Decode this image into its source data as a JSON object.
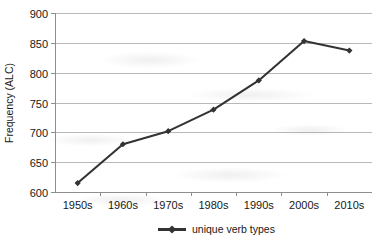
{
  "chart_data": {
    "type": "line",
    "title": "",
    "xlabel": "",
    "ylabel": "Frequency (ALC)",
    "categories": [
      "1950s",
      "1960s",
      "1970s",
      "1980s",
      "1990s",
      "2000s",
      "2010s"
    ],
    "series": [
      {
        "name": "unique verb types",
        "values": [
          615,
          680,
          702,
          738,
          787,
          853,
          837
        ],
        "color": "#333333",
        "marker": "diamond"
      }
    ],
    "ylim": [
      600,
      900
    ],
    "yticks": [
      600,
      650,
      700,
      750,
      800,
      850,
      900
    ],
    "ytick_labels": [
      "600",
      "650",
      "700",
      "750",
      "800",
      "850",
      "900"
    ],
    "grid": "horizontal",
    "grid_color": "#b9b9b9",
    "legend_position": "bottom",
    "legend_entries": [
      "unique verb types"
    ],
    "plot_background": "#ffffff",
    "axis_color": "#9a9a9a"
  },
  "axes": {
    "y_title": "Frequency (ALC)"
  },
  "legend": {
    "entry_0": "unique verb types"
  },
  "ticks": {
    "y": {
      "t0": "600",
      "t1": "650",
      "t2": "700",
      "t3": "750",
      "t4": "800",
      "t5": "850",
      "t6": "900"
    },
    "x": {
      "t0": "1950s",
      "t1": "1960s",
      "t2": "1970s",
      "t3": "1980s",
      "t4": "1990s",
      "t5": "2000s",
      "t6": "2010s"
    }
  }
}
